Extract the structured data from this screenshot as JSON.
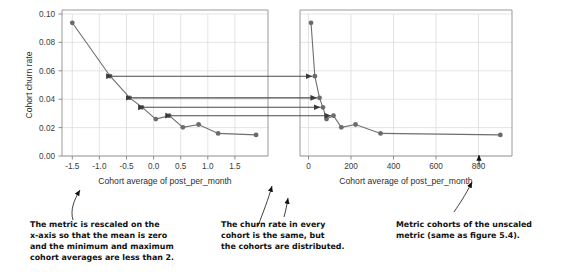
{
  "figure": {
    "title": "",
    "panels": [
      {
        "id": "left-panel",
        "name": "scaled-metric-panel",
        "xlabel": "Cohort average of post_per_month",
        "ylabel": "Cohort churn rate",
        "xticks": [
          "-1.5",
          "-1.0",
          "-0.5",
          "0.0",
          "0.5",
          "1.0",
          "1.5"
        ],
        "yticks": [
          "0.00",
          "0.02",
          "0.04",
          "0.06",
          "0.08",
          "0.10"
        ]
      },
      {
        "id": "right-panel",
        "name": "unscaled-metric-panel",
        "xlabel": "Cohort average of post_per_month",
        "ylabel": "",
        "xticks": [
          "0",
          "200",
          "400",
          "600",
          "800"
        ],
        "yticks": []
      }
    ],
    "annotations": [
      {
        "id": "note-left",
        "name": "annotation-rescaled-metric",
        "lines": [
          "The metric is rescaled on the",
          "x-axis so that the mean is zero",
          "and the minimum and maximum",
          "cohort averages are less than 2."
        ]
      },
      {
        "id": "note-middle",
        "name": "annotation-same-churn-rate",
        "lines": [
          "The churn rate in every",
          "cohort is the same, but",
          "the cohorts are distributed."
        ]
      },
      {
        "id": "note-right",
        "name": "annotation-unscaled-cohorts",
        "lines": [
          "Metric cohorts of the unscaled",
          "metric (same as figure 5.4)."
        ]
      }
    ],
    "colors": {
      "marker": "#6b6b6b",
      "line": "#6e6e6e",
      "grid": "#d9d9d9",
      "spine": "#9a9a9a",
      "link_arrow": "#4a4a4a",
      "note_text": "#111111",
      "background": "#ffffff"
    }
  },
  "chart_data": [
    {
      "type": "line",
      "id": "scaled",
      "title": "",
      "xlabel": "Cohort average of post_per_month",
      "ylabel": "Cohort churn rate",
      "xlim": [
        -1.85,
        1.95
      ],
      "ylim": [
        0.0,
        0.105
      ],
      "xticks": [
        -1.5,
        -1.0,
        -0.5,
        0.0,
        0.5,
        1.0,
        1.5
      ],
      "yticks": [
        0.0,
        0.02,
        0.04,
        0.06,
        0.08,
        0.1
      ],
      "grid": true,
      "legend": "none",
      "markers": true,
      "x": [
        -1.66,
        -0.96,
        -0.6,
        -0.37,
        -0.12,
        0.13,
        0.38,
        0.67,
        1.03,
        1.73
      ],
      "y": [
        0.0985,
        0.059,
        0.043,
        0.036,
        0.0273,
        0.0298,
        0.0212,
        0.0233,
        0.0167,
        0.0156
      ]
    },
    {
      "type": "line",
      "id": "unscaled",
      "title": "",
      "xlabel": "Cohort average of post_per_month",
      "ylabel": "",
      "xlim": [
        -40,
        960
      ],
      "ylim": [
        0.0,
        0.105
      ],
      "xticks": [
        0,
        200,
        400,
        600,
        800
      ],
      "yticks": [
        0.0,
        0.02,
        0.04,
        0.06,
        0.08,
        0.1
      ],
      "grid": true,
      "legend": "none",
      "markers": true,
      "x": [
        12,
        30,
        52,
        68,
        85,
        118,
        155,
        222,
        340,
        905
      ],
      "y": [
        0.0985,
        0.059,
        0.043,
        0.036,
        0.0273,
        0.0298,
        0.0212,
        0.0233,
        0.0167,
        0.0156
      ]
    }
  ],
  "link_arrows": [
    {
      "name": "link-arrow-0.059",
      "value": 0.059
    },
    {
      "name": "link-arrow-0.043",
      "value": 0.043
    },
    {
      "name": "link-arrow-0.036",
      "value": 0.036
    },
    {
      "name": "link-arrow-0.030",
      "value": 0.0298
    }
  ]
}
